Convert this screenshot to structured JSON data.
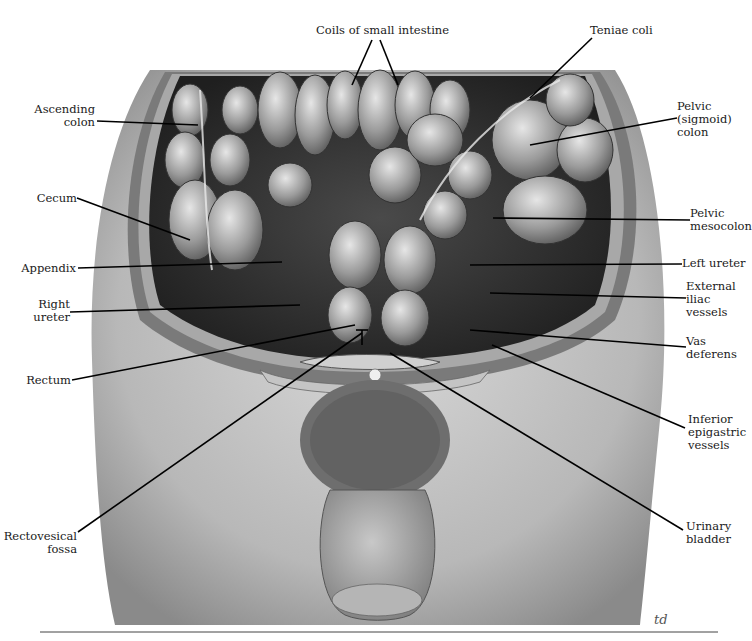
{
  "figure": {
    "signature": "td"
  },
  "labels": {
    "top": [
      {
        "id": "coils",
        "text": "Coils of small intestine"
      },
      {
        "id": "teniae",
        "text": "Teniae coli"
      }
    ],
    "left": [
      {
        "id": "ascending",
        "lines": [
          "Ascending",
          "colon"
        ]
      },
      {
        "id": "cecum",
        "lines": [
          "Cecum"
        ]
      },
      {
        "id": "appendix",
        "lines": [
          "Appendix"
        ]
      },
      {
        "id": "right_ureter",
        "lines": [
          "Right",
          "ureter"
        ]
      },
      {
        "id": "rectum",
        "lines": [
          "Rectum"
        ]
      },
      {
        "id": "rectovesical",
        "lines": [
          "Rectovesical",
          "fossa"
        ]
      }
    ],
    "right": [
      {
        "id": "pelvic_colon",
        "lines": [
          "Pelvic",
          "(sigmoid)",
          "colon"
        ]
      },
      {
        "id": "pelvic_mesocolon",
        "lines": [
          "Pelvic",
          "mesocolon"
        ]
      },
      {
        "id": "left_ureter",
        "lines": [
          "Left ureter"
        ]
      },
      {
        "id": "external_iliac",
        "lines": [
          "External",
          "iliac",
          "vessels"
        ]
      },
      {
        "id": "vas_deferens",
        "lines": [
          "Vas",
          "deferens"
        ]
      },
      {
        "id": "inferior_epigastric",
        "lines": [
          "Inferior",
          "epigastric",
          "vessels"
        ]
      },
      {
        "id": "urinary_bladder",
        "lines": [
          "Urinary",
          "bladder"
        ]
      }
    ]
  }
}
